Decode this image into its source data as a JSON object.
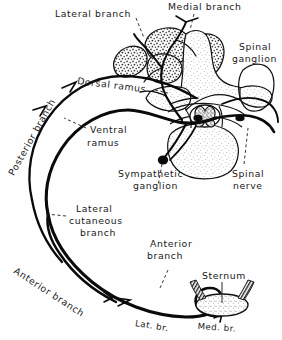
{
  "figure": {
    "width": 282,
    "height": 340,
    "background": "#fefefe",
    "ink": "#111111"
  },
  "labels": {
    "lateral_branch": "Lateral  branch",
    "medial_branch": "Medial  branch",
    "spinal_ganglion_line1": "Spinal",
    "spinal_ganglion_line2": "ganglion",
    "dorsal_ramus": "Dorsal  ramus",
    "posterior_branch": "Posterior branch",
    "ventral_line1": "Ventral",
    "ventral_line2": "ramus",
    "sympathetic_line1": "Sympathetic",
    "sympathetic_line2": "ganglion",
    "spinal_nerve_line1": "Spinal",
    "spinal_nerve_line2": "nerve",
    "lateral_cutaneous_line1": "Lateral",
    "lateral_cutaneous_line2": "cutaneous",
    "lateral_cutaneous_line3": "branch",
    "anterior_branch_mid_line1": "Anterior",
    "anterior_branch_mid_line2": "branch",
    "anterior_branch_lower": "Anterior  branch",
    "sternum": "Sternum",
    "lat_br": "Lat. br.",
    "med_br": "Med. br."
  },
  "structures": [
    {
      "name": "erector-spinae-muscle-mass",
      "style": "stippled"
    },
    {
      "name": "vertebra-cross-section",
      "style": "stippled-outline"
    },
    {
      "name": "spinal-cord",
      "style": "butterfly-gray-matter"
    },
    {
      "name": "spinal-ganglion-swelling",
      "style": "outline"
    },
    {
      "name": "sympathetic-ganglion-node",
      "style": "solid-black"
    },
    {
      "name": "intercostal-nerve-trunk",
      "style": "heavy-line"
    },
    {
      "name": "posterior-branch-curve",
      "style": "heavy-line"
    },
    {
      "name": "sternum-cross-section",
      "style": "stippled"
    },
    {
      "name": "costal-cartilage-hatching",
      "style": "hatched"
    }
  ]
}
